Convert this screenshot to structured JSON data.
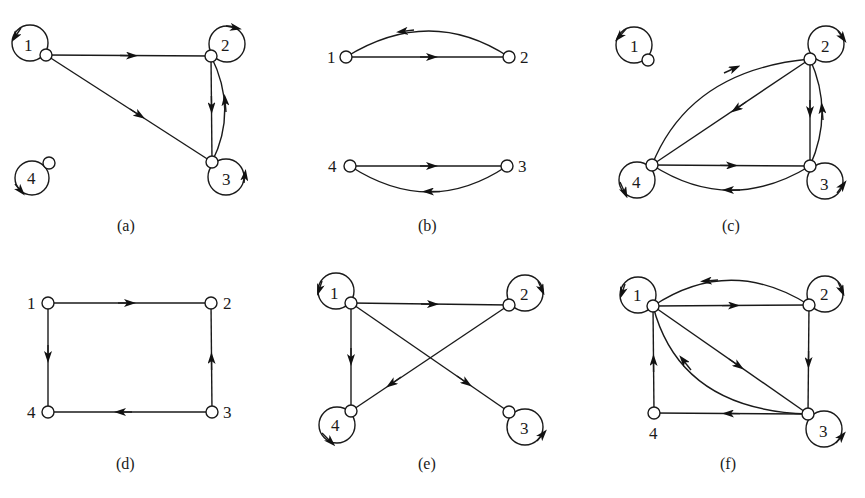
{
  "figure": {
    "panels": [
      {
        "id": "a",
        "caption": "(a)",
        "nodes": [
          {
            "id": "1",
            "label": "1",
            "self_loop": true
          },
          {
            "id": "2",
            "label": "2",
            "self_loop": true
          },
          {
            "id": "3",
            "label": "3",
            "self_loop": true
          },
          {
            "id": "4",
            "label": "4",
            "self_loop": true
          }
        ],
        "edges": [
          {
            "from": "1",
            "to": "2"
          },
          {
            "from": "1",
            "to": "3"
          },
          {
            "from": "2",
            "to": "3"
          },
          {
            "from": "3",
            "to": "2"
          }
        ]
      },
      {
        "id": "b",
        "caption": "(b)",
        "nodes": [
          {
            "id": "1",
            "label": "1",
            "self_loop": false
          },
          {
            "id": "2",
            "label": "2",
            "self_loop": false
          },
          {
            "id": "3",
            "label": "3",
            "self_loop": false
          },
          {
            "id": "4",
            "label": "4",
            "self_loop": false
          }
        ],
        "edges": [
          {
            "from": "1",
            "to": "2"
          },
          {
            "from": "2",
            "to": "1"
          },
          {
            "from": "4",
            "to": "3"
          },
          {
            "from": "3",
            "to": "4"
          }
        ]
      },
      {
        "id": "c",
        "caption": "(c)",
        "nodes": [
          {
            "id": "1",
            "label": "1",
            "self_loop": true
          },
          {
            "id": "2",
            "label": "2",
            "self_loop": true
          },
          {
            "id": "3",
            "label": "3",
            "self_loop": true
          },
          {
            "id": "4",
            "label": "4",
            "self_loop": true
          }
        ],
        "edges": [
          {
            "from": "4",
            "to": "2"
          },
          {
            "from": "2",
            "to": "4"
          },
          {
            "from": "2",
            "to": "3"
          },
          {
            "from": "3",
            "to": "2"
          },
          {
            "from": "4",
            "to": "3"
          },
          {
            "from": "3",
            "to": "4"
          }
        ]
      },
      {
        "id": "d",
        "caption": "(d)",
        "nodes": [
          {
            "id": "1",
            "label": "1",
            "self_loop": false
          },
          {
            "id": "2",
            "label": "2",
            "self_loop": false
          },
          {
            "id": "3",
            "label": "3",
            "self_loop": false
          },
          {
            "id": "4",
            "label": "4",
            "self_loop": false
          }
        ],
        "edges": [
          {
            "from": "1",
            "to": "2"
          },
          {
            "from": "1",
            "to": "4"
          },
          {
            "from": "3",
            "to": "2"
          },
          {
            "from": "3",
            "to": "4"
          }
        ]
      },
      {
        "id": "e",
        "caption": "(e)",
        "nodes": [
          {
            "id": "1",
            "label": "1",
            "self_loop": true
          },
          {
            "id": "2",
            "label": "2",
            "self_loop": true
          },
          {
            "id": "3",
            "label": "3",
            "self_loop": true
          },
          {
            "id": "4",
            "label": "4",
            "self_loop": true
          }
        ],
        "edges": [
          {
            "from": "1",
            "to": "2"
          },
          {
            "from": "1",
            "to": "3"
          },
          {
            "from": "1",
            "to": "4"
          },
          {
            "from": "2",
            "to": "4"
          }
        ]
      },
      {
        "id": "f",
        "caption": "(f)",
        "nodes": [
          {
            "id": "1",
            "label": "1",
            "self_loop": true
          },
          {
            "id": "2",
            "label": "2",
            "self_loop": true
          },
          {
            "id": "3",
            "label": "3",
            "self_loop": true
          },
          {
            "id": "4",
            "label": "4",
            "self_loop": false
          }
        ],
        "edges": [
          {
            "from": "1",
            "to": "2"
          },
          {
            "from": "2",
            "to": "1"
          },
          {
            "from": "1",
            "to": "3"
          },
          {
            "from": "3",
            "to": "1"
          },
          {
            "from": "2",
            "to": "3"
          },
          {
            "from": "3",
            "to": "4"
          },
          {
            "from": "4",
            "to": "1"
          }
        ]
      }
    ]
  }
}
